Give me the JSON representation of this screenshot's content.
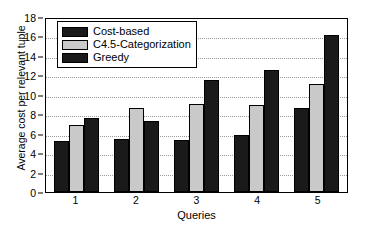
{
  "chart_data": {
    "type": "bar",
    "title": "",
    "xlabel": "Queries",
    "ylabel": "Average cost per relevant tuple",
    "categories": [
      "1",
      "2",
      "3",
      "4",
      "5"
    ],
    "ylim": [
      0,
      18
    ],
    "yticks": [
      0,
      2,
      4,
      6,
      8,
      10,
      12,
      14,
      16,
      18
    ],
    "grid": true,
    "legend_position": "top-left",
    "series": [
      {
        "name": "Cost-based",
        "color": "#1a1a1a",
        "values": [
          5.2,
          5.5,
          5.3,
          5.9,
          8.6
        ]
      },
      {
        "name": "C4.5-Categorization",
        "color": "#c9c9c9",
        "values": [
          6.9,
          8.6,
          9.1,
          8.9,
          11.1
        ]
      },
      {
        "name": "Greedy",
        "color": "#1a1a1a",
        "values": [
          7.6,
          7.3,
          11.5,
          12.5,
          16.2
        ]
      }
    ]
  }
}
